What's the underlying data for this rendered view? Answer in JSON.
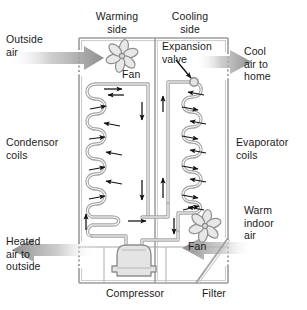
{
  "diagram": {
    "type": "technical-illustration",
    "background_color": "#ffffff",
    "line_color": "#999999",
    "text_color": "#1a1a1a",
    "arrow_color": "#9a9a9a"
  },
  "labels": {
    "warming_side": "Warming\nside",
    "cooling_side": "Cooling\nside",
    "outside_air": "Outside\nair",
    "cool_air_to_home": "Cool\nair to\nhome",
    "expansion_valve": "Expansion\nvalve",
    "fan_left": "Fan",
    "condensor_coils": "Condensor\ncoils",
    "evaporator_coils": "Evaporator\ncoils",
    "warm_indoor_air": "Warm\nindoor\nair",
    "fan_right": "Fan",
    "heated_air_to_outside": "Heated\nair to\noutside",
    "compressor": "Compressor",
    "filter": "Filter"
  },
  "components": {
    "housing": {
      "name": "outer-housing",
      "x": 79,
      "y": 38,
      "width": 149,
      "height": 245
    },
    "center_divider": {
      "name": "center-divider",
      "x": 155,
      "y": 38,
      "height": 245
    },
    "fan_left": {
      "name": "condenser-fan",
      "cx": 122,
      "cy": 55,
      "blades": 6
    },
    "fan_right": {
      "name": "evaporator-fan",
      "cx": 205,
      "cy": 226,
      "blades": 6
    },
    "expansion_valve": {
      "name": "expansion-valve",
      "cx": 194,
      "cy": 82,
      "radius": 4
    },
    "compressor": {
      "name": "compressor",
      "cx": 134,
      "cy": 262
    },
    "filter": {
      "name": "filter",
      "x1": 196,
      "y1": 283,
      "x2": 228,
      "y2": 240
    },
    "condenser_coil": {
      "name": "condenser-coil",
      "loops": 5,
      "side": "left"
    },
    "evaporator_coil": {
      "name": "evaporator-coil",
      "loops": 5,
      "side": "right"
    }
  },
  "air_flow_arrows": [
    {
      "name": "outside-air-in",
      "direction": "right",
      "x": 12,
      "y": 58
    },
    {
      "name": "cool-air-out",
      "direction": "right",
      "x": 222,
      "y": 62
    },
    {
      "name": "heated-air-out",
      "direction": "left",
      "x": 12,
      "y": 250
    },
    {
      "name": "warm-indoor-in",
      "direction": "left",
      "x": 222,
      "y": 248
    }
  ]
}
